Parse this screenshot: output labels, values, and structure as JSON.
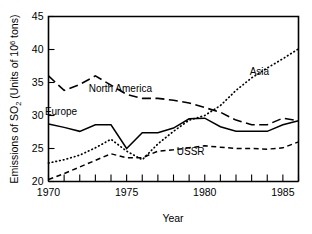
{
  "chart_data": {
    "type": "line",
    "title": "",
    "xlabel": "Year",
    "ylabel": "Emissions of SO2 (Units of 10^6 tons)",
    "ylabel_parts": {
      "prefix": "Emissions of SO",
      "sub": "2",
      "mid": " (Units of 10",
      "sup": "6",
      "suffix": " tons)"
    },
    "xlim": [
      1970,
      1986
    ],
    "ylim": [
      20,
      45
    ],
    "grid": false,
    "legend_position": "inline-annotations",
    "x_ticks_major": [
      1970,
      1975,
      1980,
      1985
    ],
    "x_ticks_major_labels": [
      "1970",
      "1975",
      "1980",
      "1985"
    ],
    "x_ticks_minor": [
      1971,
      1972,
      1973,
      1974,
      1976,
      1977,
      1978,
      1979,
      1981,
      1982,
      1983,
      1984,
      1986
    ],
    "y_ticks": [
      20,
      25,
      30,
      35,
      40,
      45
    ],
    "y_tick_labels": [
      "20",
      "25",
      "30",
      "35",
      "40",
      "45"
    ],
    "x": [
      1970,
      1971,
      1972,
      1973,
      1974,
      1975,
      1976,
      1977,
      1978,
      1979,
      1980,
      1981,
      1982,
      1983,
      1984,
      1985,
      1986
    ],
    "series": [
      {
        "name": "North America",
        "style": "long-dash",
        "color": "#000000",
        "label_x": 1974.6,
        "label_y": 33.6,
        "values": [
          36.0,
          33.8,
          34.7,
          36.0,
          34.6,
          33.2,
          32.6,
          32.6,
          32.3,
          31.9,
          31.2,
          30.5,
          29.3,
          28.6,
          28.6,
          29.6,
          29.2
        ]
      },
      {
        "name": "Europe",
        "style": "solid",
        "color": "#000000",
        "label_x": 1970.8,
        "label_y": 30.1,
        "values": [
          28.7,
          28.2,
          27.6,
          28.6,
          28.6,
          25.0,
          27.4,
          27.4,
          28.1,
          29.5,
          29.6,
          28.3,
          27.6,
          27.6,
          27.6,
          28.6,
          29.2
        ]
      },
      {
        "name": "USSR",
        "style": "dash",
        "color": "#000000",
        "label_x": 1979.1,
        "label_y": 24.0,
        "values": [
          20.3,
          21.2,
          22.2,
          23.2,
          24.2,
          23.6,
          23.6,
          24.6,
          24.8,
          25.1,
          25.4,
          25.2,
          25.0,
          25.0,
          24.9,
          25.1,
          26.0
        ]
      },
      {
        "name": "Asia",
        "style": "dotted",
        "color": "#000000",
        "label_x": 1983.5,
        "label_y": 36.2,
        "values": [
          22.8,
          23.3,
          24.0,
          25.1,
          26.4,
          24.6,
          23.3,
          25.7,
          27.6,
          29.3,
          30.0,
          31.5,
          33.8,
          35.7,
          37.2,
          38.6,
          40.1
        ]
      }
    ]
  }
}
